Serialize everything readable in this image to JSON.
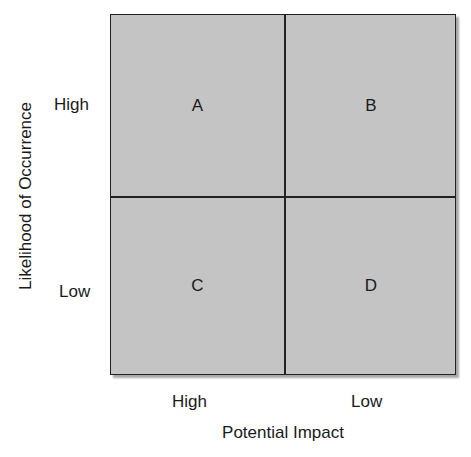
{
  "diagram": {
    "type": "2x2 risk matrix",
    "x_axis": {
      "title": "Potential Impact",
      "ticks": [
        "High",
        "Low"
      ]
    },
    "y_axis": {
      "title": "Likelihood of Occurrence",
      "ticks": [
        "High",
        "Low"
      ]
    },
    "quadrants": [
      {
        "label": "A",
        "impact": "High",
        "likelihood": "High"
      },
      {
        "label": "B",
        "impact": "Low",
        "likelihood": "High"
      },
      {
        "label": "C",
        "impact": "High",
        "likelihood": "Low"
      },
      {
        "label": "D",
        "impact": "Low",
        "likelihood": "Low"
      }
    ],
    "colors": {
      "fill": "#c4c4c4",
      "border": "#222222"
    }
  }
}
